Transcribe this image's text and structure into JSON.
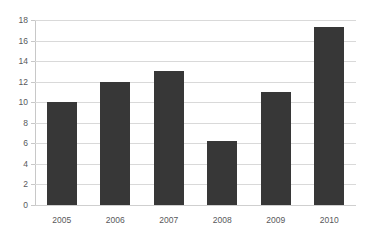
{
  "chart_data": {
    "type": "bar",
    "title": "",
    "subtitle": "",
    "xlabel": "",
    "ylabel": "",
    "categories": [
      "2005",
      "2006",
      "2007",
      "2008",
      "2009",
      "2010"
    ],
    "values": [
      10,
      12,
      13,
      6.2,
      11,
      17.3
    ],
    "series": [
      {
        "name": "",
        "values": [
          10,
          12,
          13,
          6.2,
          11,
          17.3
        ]
      }
    ],
    "ylim": [
      0,
      18
    ],
    "y_ticks": [
      0,
      2,
      4,
      6,
      8,
      10,
      12,
      14,
      16,
      18
    ],
    "y_tick_labels": [
      "0",
      "2",
      "4",
      "6",
      "8",
      "10",
      "12",
      "14",
      "16",
      "18"
    ],
    "grid": true,
    "grid_axis": "y",
    "legend": false,
    "legend_position": "none",
    "bar_color": "#373737",
    "gridline_color": "#d9d9d9",
    "axis_color": "#c8c8c8",
    "tick_label_color": "#58595b",
    "background_color": "#ffffff"
  }
}
